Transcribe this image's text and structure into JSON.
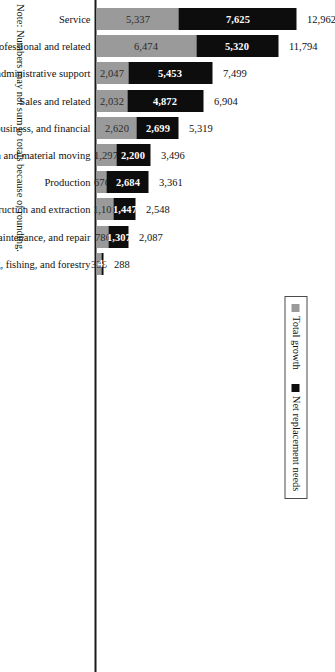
{
  "chart_data": {
    "type": "bar",
    "subtype": "stacked-horizontal-bar",
    "title": "",
    "xlabel": "",
    "ylabel": "",
    "orientation": "horizontal",
    "grid": false,
    "axis_range": [
      0,
      13000
    ],
    "categories": [
      "Service",
      "Professional and related",
      "Office and administrative support",
      "Sales and related",
      "Management, business, and financial",
      "Transportation and material moving",
      "Production",
      "Construction and extraction",
      "Installation, maintenance, and repair",
      "Farming, fishing, and forestry"
    ],
    "series": [
      {
        "name": "Total growth",
        "color": "#9a9a9a",
        "values": [
          5337,
          6474,
          2047,
          2032,
          2620,
          1297,
          676,
          1101,
          780,
          335
        ]
      },
      {
        "name": "Net replacement needs",
        "color": "#0d0d0d",
        "values": [
          7625,
          5320,
          5453,
          4872,
          2699,
          2200,
          2684,
          1447,
          1307,
          47
        ]
      }
    ],
    "totals": [
      12962,
      11794,
      7499,
      6904,
      5319,
      3496,
      3361,
      2548,
      2087,
      288
    ],
    "value_labels": {
      "growth": [
        "5,337",
        "6,474",
        "2,047",
        "2,032",
        "2,620",
        "1,297",
        "676",
        "1,101",
        "780",
        "335"
      ],
      "replacement": [
        "7,625",
        "5,320",
        "5,453",
        "4,872",
        "2,699",
        "2,200",
        "2,684",
        "1,447",
        "1,307",
        "47"
      ],
      "totals": [
        "12,962",
        "11,794",
        "7,499",
        "6,904",
        "5,319",
        "3,496",
        "3,361",
        "2,548",
        "2,087",
        "288"
      ]
    },
    "legend": {
      "position": "top-right",
      "entries": [
        {
          "label": "Total growth",
          "color": "#9a9a9a"
        },
        {
          "label": "Net replacement needs",
          "color": "#0d0d0d"
        }
      ]
    },
    "annotations": [
      "Note: Numbers may not sum to totals because of rounding."
    ]
  },
  "legend": {
    "growth_label": "Total growth",
    "replacement_label": "Net replacement needs"
  },
  "note": {
    "text": "Note: Numbers may not sum to totals because of rounding."
  }
}
